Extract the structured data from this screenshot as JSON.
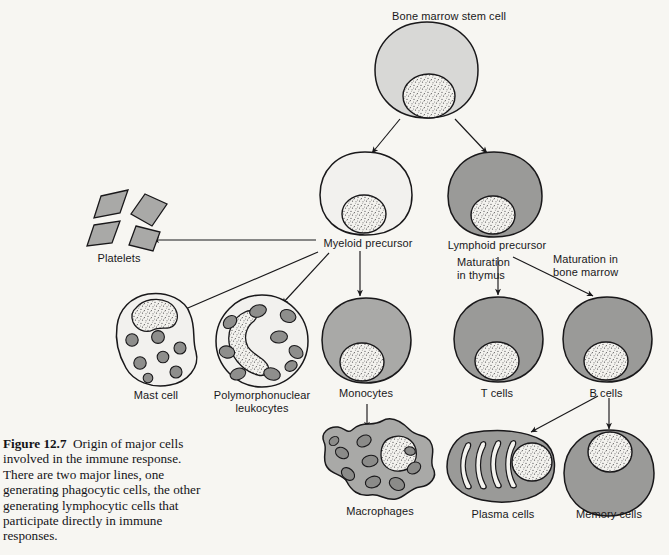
{
  "figure": {
    "number": "Figure 12.7",
    "caption_text": "Origin of major cells involved in the immune response. There are two major lines, one generating phagocytic cells, the other generating lymphocytic cells that participate directly in immune responses.",
    "background_color": "#f7f6f2"
  },
  "palette": {
    "ink": "#19181a",
    "cell_pale": "#f2f1ee",
    "cell_light": "#d8d8d6",
    "cell_mid": "#a9a9a7",
    "cell_dark": "#8f8f8d",
    "granule": "#8e8e8c",
    "nucleus": "#efeeea"
  },
  "nodes": {
    "stem_cell": {
      "label": "Bone marrow stem cell",
      "fill": "#d8d8d6"
    },
    "myeloid_precursor": {
      "label": "Myeloid precursor",
      "fill": "#f2f1ee"
    },
    "lymphoid_precursor": {
      "label": "Lymphoid precursor",
      "fill": "#9a9a98"
    },
    "platelets": {
      "label": "Platelets",
      "fill": "#a9a9a7",
      "count": 4
    },
    "mast_cell": {
      "label": "Mast cell",
      "fill": "#f2f1ee",
      "granules": 7
    },
    "pmn_leukocytes": {
      "label": "Polymorphonuclear\nleukocytes",
      "fill": "#f2f1ee",
      "granules": 9
    },
    "monocytes": {
      "label": "Monocytes",
      "fill": "#a9a9a7"
    },
    "macrophages": {
      "label": "Macrophages",
      "fill": "#a9a9a7",
      "vacuoles": 9
    },
    "t_cells": {
      "label": "T cells",
      "fill": "#9a9a98"
    },
    "b_cells": {
      "label": "B cells",
      "fill": "#9a9a98"
    },
    "plasma_cells": {
      "label": "Plasma cells",
      "fill": "#9a9a98",
      "er_channels": 4
    },
    "memory_cells": {
      "label": "Memory cells",
      "fill": "#9a9a98"
    }
  },
  "annotations": {
    "maturation_thymus": "Maturation\nin thymus",
    "maturation_bone_marrow": "Maturation in\nbone marrow"
  },
  "edges": [
    {
      "from": "stem_cell",
      "to": "myeloid_precursor"
    },
    {
      "from": "stem_cell",
      "to": "lymphoid_precursor"
    },
    {
      "from": "myeloid_precursor",
      "to": "platelets"
    },
    {
      "from": "myeloid_precursor",
      "to": "mast_cell"
    },
    {
      "from": "myeloid_precursor",
      "to": "pmn_leukocytes"
    },
    {
      "from": "myeloid_precursor",
      "to": "monocytes"
    },
    {
      "from": "monocytes",
      "to": "macrophages"
    },
    {
      "from": "lymphoid_precursor",
      "to": "t_cells"
    },
    {
      "from": "lymphoid_precursor",
      "to": "b_cells"
    },
    {
      "from": "b_cells",
      "to": "plasma_cells"
    },
    {
      "from": "b_cells",
      "to": "memory_cells"
    }
  ]
}
